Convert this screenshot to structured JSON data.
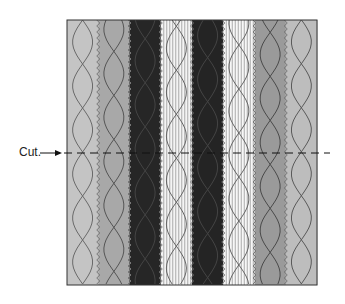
{
  "diagram": {
    "title": "",
    "cut_label": "Cut.",
    "frame": {
      "x": 67,
      "y": 20,
      "width": 250,
      "height": 265
    },
    "cut_line": {
      "y": 153,
      "x_start": 50,
      "x_end": 330,
      "arrow_from": 40,
      "arrow_to": 62
    },
    "strips": [
      {
        "name": "strip-1",
        "fill": "#c4c4c4",
        "pattern": "plain",
        "zigzag_left": false,
        "wave": "#6a6a6a"
      },
      {
        "name": "strip-2",
        "fill": "#a8a8a8",
        "pattern": "plain",
        "zigzag_left": true,
        "wave": "#555555"
      },
      {
        "name": "strip-3",
        "fill": "#262626",
        "pattern": "plain",
        "zigzag_left": true,
        "wave": "#444444"
      },
      {
        "name": "strip-4",
        "fill": "#f4f4f4",
        "pattern": "pinstripe",
        "zigzag_left": true,
        "wave": "#666666"
      },
      {
        "name": "strip-5",
        "fill": "#242424",
        "pattern": "plain",
        "zigzag_left": true,
        "wave": "#444444"
      },
      {
        "name": "strip-6",
        "fill": "#f7f7f7",
        "pattern": "pinstripe",
        "zigzag_left": true,
        "wave": "#666666"
      },
      {
        "name": "strip-7",
        "fill": "#9a9a9a",
        "pattern": "plain",
        "zigzag_left": true,
        "wave": "#4a4a4a"
      },
      {
        "name": "strip-8",
        "fill": "#bdbdbd",
        "pattern": "plain",
        "zigzag_left": true,
        "wave": "#5a5a5a"
      }
    ]
  }
}
